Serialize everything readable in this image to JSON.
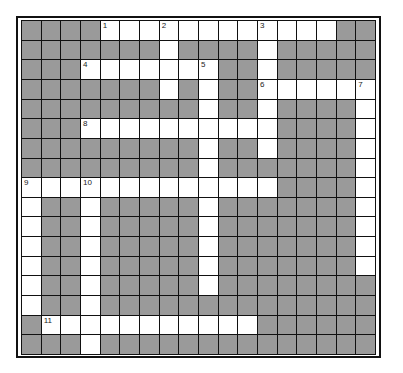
{
  "puzzle": {
    "cols": 18,
    "rows": 17,
    "colors": {
      "block": "#9a9a9a",
      "open": "#ffffff",
      "line": "#111111"
    },
    "white_cells": {
      "0": [
        4,
        5,
        6,
        7,
        8,
        9,
        10,
        11,
        12,
        13,
        14,
        15
      ],
      "1": [
        7,
        12
      ],
      "2": [
        3,
        4,
        5,
        6,
        7,
        8,
        9,
        12
      ],
      "3": [
        7,
        9,
        12,
        13,
        14,
        15,
        16,
        17
      ],
      "4": [
        9,
        12,
        17
      ],
      "5": [
        3,
        4,
        5,
        6,
        7,
        8,
        9,
        10,
        11,
        12,
        17
      ],
      "6": [
        9,
        12,
        17
      ],
      "7": [
        9,
        17
      ],
      "8": [
        0,
        1,
        2,
        3,
        4,
        5,
        6,
        7,
        8,
        9,
        10,
        11,
        12,
        17
      ],
      "9": [
        0,
        3,
        9,
        17
      ],
      "10": [
        0,
        3,
        9,
        17
      ],
      "11": [
        0,
        3,
        9,
        17
      ],
      "12": [
        0,
        3,
        9,
        17
      ],
      "13": [
        0,
        3,
        9
      ],
      "14": [
        0,
        3
      ],
      "15": [
        1,
        2,
        3,
        4,
        5,
        6,
        7,
        8,
        9,
        10,
        11
      ],
      "16": [
        3
      ]
    },
    "numbers": [
      {
        "label": "1",
        "row": 0,
        "col": 4
      },
      {
        "label": "2",
        "row": 0,
        "col": 7
      },
      {
        "label": "3",
        "row": 0,
        "col": 12
      },
      {
        "label": "4",
        "row": 2,
        "col": 3
      },
      {
        "label": "5",
        "row": 2,
        "col": 9
      },
      {
        "label": "6",
        "row": 3,
        "col": 12
      },
      {
        "label": "7",
        "row": 3,
        "col": 17
      },
      {
        "label": "8",
        "row": 5,
        "col": 3
      },
      {
        "label": "9",
        "row": 8,
        "col": 0
      },
      {
        "label": "10",
        "row": 8,
        "col": 3
      },
      {
        "label": "11",
        "row": 15,
        "col": 1
      }
    ],
    "entries": {
      "across": [
        {
          "number": "1",
          "row": 0,
          "col": 4,
          "length": 12
        },
        {
          "number": "4",
          "row": 2,
          "col": 3,
          "length": 7
        },
        {
          "number": "6",
          "row": 3,
          "col": 12,
          "length": 6
        },
        {
          "number": "8",
          "row": 5,
          "col": 3,
          "length": 10
        },
        {
          "number": "9",
          "row": 8,
          "col": 0,
          "length": 13
        },
        {
          "number": "11",
          "row": 15,
          "col": 1,
          "length": 11
        }
      ],
      "down": [
        {
          "number": "2",
          "row": 0,
          "col": 7,
          "length": 4
        },
        {
          "number": "3",
          "row": 0,
          "col": 12,
          "length": 7
        },
        {
          "number": "5",
          "row": 2,
          "col": 9,
          "length": 12
        },
        {
          "number": "7",
          "row": 3,
          "col": 17,
          "length": 10
        },
        {
          "number": "9",
          "row": 8,
          "col": 0,
          "length": 7
        },
        {
          "number": "10",
          "row": 8,
          "col": 3,
          "length": 9
        }
      ]
    }
  }
}
